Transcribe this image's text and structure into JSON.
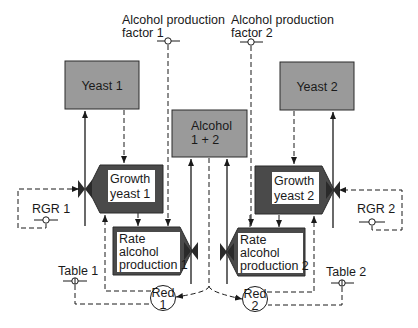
{
  "diagram": {
    "type": "Forrester relational diagram (systems dynamics)",
    "states": {
      "yeast1": "Yeast 1",
      "yeast2": "Yeast 2",
      "alcohol_line1": "Alcohol",
      "alcohol_line2": "1 + 2"
    },
    "rates": {
      "growth1_line1": "Growth",
      "growth1_line2": "yeast 1",
      "growth2_line1": "Growth",
      "growth2_line2": "yeast 2",
      "rap1_line1": "Rate",
      "rap1_line2": "alcohol",
      "rap1_line3": "production 1",
      "rap2_line1": "Rate",
      "rap2_line2": "alcohol",
      "rap2_line3": "production 2"
    },
    "parameters": {
      "apf1_line1": "Alcohol production",
      "apf1_line2": "factor 1",
      "apf2_line1": "Alcohol production",
      "apf2_line2": "factor 2",
      "rgr1": "RGR 1",
      "rgr2": "RGR 2",
      "table1": "Table 1",
      "table2": "Table 2"
    },
    "auxiliaries": {
      "red1_line1": "Red",
      "red1_line2": "1",
      "red2_line1": "Red",
      "red2_line2": "2"
    },
    "colors": {
      "state_fill": "#9a9a9a",
      "rate_fill": "#4a4a4a",
      "line": "#1a1a1a",
      "background": "#ffffff"
    }
  }
}
